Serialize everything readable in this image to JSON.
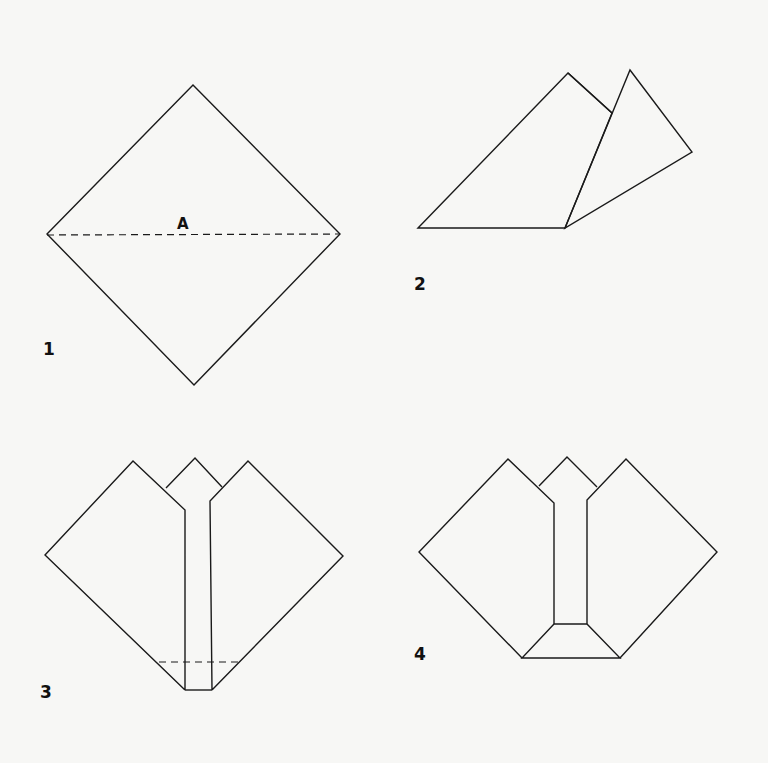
{
  "diagram": {
    "type": "origami-instructions",
    "colors": {
      "background": "#f7f7f5",
      "line": "#1a1a1a"
    },
    "steps": [
      {
        "number": "1",
        "label": "A",
        "description": "Square turned as diamond with dashed horizontal fold line A"
      },
      {
        "number": "2",
        "description": "Folded triangle with one flap folded up"
      },
      {
        "number": "3",
        "description": "Two side flaps folded with center strip and dashed fold line near bottom"
      },
      {
        "number": "4",
        "description": "Bottom point folded up forming trapezoid base"
      }
    ]
  }
}
